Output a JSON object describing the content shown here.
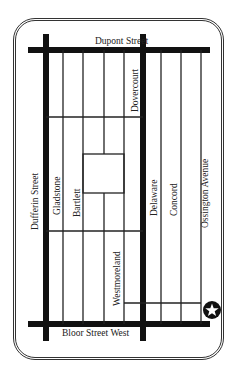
{
  "map": {
    "streets": {
      "dupont": "Dupont Street",
      "bloor": "Bloor Street West",
      "dufferin": "Dufferin Street",
      "gladstone": "Gladstone",
      "bartlett": "Bartlett",
      "dovercourt": "Dovercourt",
      "westmoreland": "Westmoreland",
      "delaware": "Delaware",
      "concord": "Concord",
      "ossington": "Ossington Avenue"
    },
    "marker": {
      "icon": "star-icon",
      "color": "#111111"
    }
  }
}
